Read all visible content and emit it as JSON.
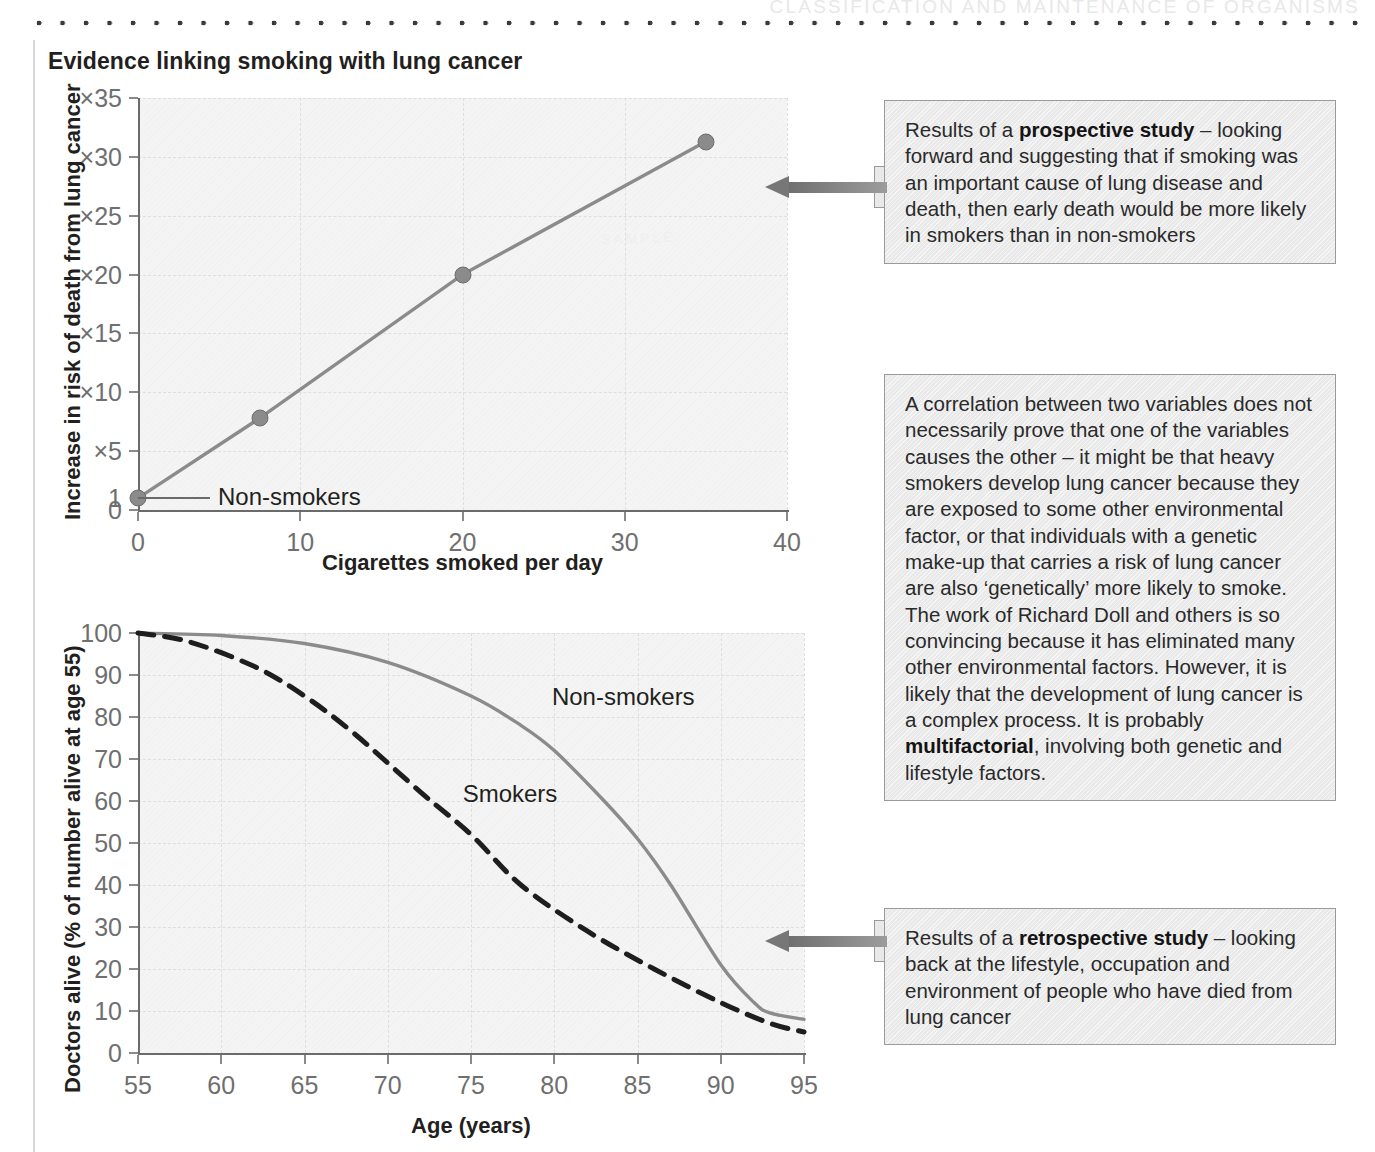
{
  "page": {
    "running_head": "CLASSIFICATION AND MAINTENANCE OF ORGANISMS",
    "title": "Evidence linking smoking with lung cancer",
    "watermark": "SAMPLE"
  },
  "callouts": [
    {
      "name": "prospective-study-callout",
      "segments": [
        {
          "text": "Results of a ",
          "bold": false
        },
        {
          "text": "prospective study",
          "bold": true
        },
        {
          "text": " – looking forward and suggesting that if smoking was an important cause of lung disease and death, then early death would be more likely in smokers than in non-smokers",
          "bold": false
        }
      ],
      "plain": "Results of a prospective study – looking forward and suggesting that if smoking was an important cause of lung disease and death, then early death would be more likely in smokers than in non-smokers"
    },
    {
      "name": "correlation-causation-callout",
      "segments": [
        {
          "text": "A correlation between two variables does not necessarily prove that one of the variables causes the other – it might be that heavy smokers develop lung cancer because they are exposed to some other environmental factor, or that individuals with a genetic make-up that carries a risk of lung cancer are also ‘genetically’ more likely to smoke. The work of Richard Doll and others is so convincing because it has eliminated many other environmental factors. However, it is likely that the development of lung cancer is a complex process. It is probably ",
          "bold": false
        },
        {
          "text": "multifactorial",
          "bold": true
        },
        {
          "text": ", involving both genetic and lifestyle factors.",
          "bold": false
        }
      ],
      "plain": "A correlation between two variables does not necessarily prove that one of the variables causes the other – it might be that heavy smokers develop lung cancer because they are exposed to some other environmental factor, or that individuals with a genetic make-up that carries a risk of lung cancer are also ‘genetically’ more likely to smoke. The work of Richard Doll and others is so convincing because it has eliminated many other environmental factors. However, it is likely that the development of lung cancer is a complex process. It is probably multifactorial, involving both genetic and lifestyle factors."
    },
    {
      "name": "retrospective-study-callout",
      "segments": [
        {
          "text": "Results of a ",
          "bold": false
        },
        {
          "text": "retrospective study",
          "bold": true
        },
        {
          "text": " – looking back at the lifestyle, occupation and environment of people who have died from lung cancer",
          "bold": false
        }
      ],
      "plain": "Results of a retrospective study – looking back at the lifestyle, occupation and environment of people who have died from lung cancer"
    }
  ],
  "chart_data": [
    {
      "id": "risk-vs-cigarettes",
      "type": "line",
      "title": "",
      "xlabel": "Cigarettes smoked per day",
      "ylabel": "Increase in risk of death from lung cancer",
      "xlim": [
        0,
        40
      ],
      "ylim": [
        0,
        35
      ],
      "xticks": [
        0,
        10,
        20,
        30,
        40
      ],
      "xticklabels": [
        "0",
        "10",
        "20",
        "30",
        "40"
      ],
      "yticks": [
        0,
        1,
        5,
        10,
        15,
        20,
        25,
        30,
        35
      ],
      "yticklabels": [
        "0",
        "1",
        "×5",
        "×10",
        "×15",
        "×20",
        "×25",
        "×30",
        "×35"
      ],
      "grid": true,
      "markers": true,
      "series": [
        {
          "name": "Increase in risk of death from lung cancer",
          "annotation": "Non-smokers",
          "color": "#8b8b8b",
          "x": [
            0,
            7.5,
            20,
            35
          ],
          "y": [
            1,
            7.8,
            20,
            31.3
          ]
        }
      ]
    },
    {
      "id": "doctors-alive-vs-age",
      "type": "line",
      "title": "",
      "xlabel": "Age (years)",
      "ylabel": "Doctors alive (% of number alive at age 55)",
      "xlim": [
        55,
        95
      ],
      "ylim": [
        0,
        100
      ],
      "xticks": [
        55,
        60,
        65,
        70,
        75,
        80,
        85,
        90,
        95
      ],
      "xticklabels": [
        "55",
        "60",
        "65",
        "70",
        "75",
        "80",
        "85",
        "90",
        "95"
      ],
      "yticks": [
        0,
        10,
        20,
        30,
        40,
        50,
        60,
        70,
        80,
        90,
        100
      ],
      "yticklabels": [
        "0",
        "10",
        "20",
        "30",
        "40",
        "50",
        "60",
        "70",
        "80",
        "90",
        "100"
      ],
      "grid": true,
      "legend_position": "inline-labels",
      "series": [
        {
          "name": "Non-smokers",
          "style": "solid",
          "color": "#8b8b8b",
          "x": [
            55,
            60,
            65,
            70,
            75,
            78,
            80,
            83,
            85,
            87,
            90,
            92,
            93,
            95
          ],
          "y": [
            100,
            99.4,
            97.5,
            93,
            85,
            78,
            72,
            60,
            51,
            40,
            21,
            12,
            9.5,
            8
          ]
        },
        {
          "name": "Smokers",
          "style": "dashed",
          "color": "#1e1e1e",
          "x": [
            55,
            58,
            62,
            65,
            68,
            72,
            75,
            78,
            82,
            86,
            90,
            93,
            95
          ],
          "y": [
            100,
            98,
            92,
            85,
            76,
            62,
            52,
            40,
            29,
            20,
            12,
            7,
            5
          ]
        }
      ]
    }
  ]
}
